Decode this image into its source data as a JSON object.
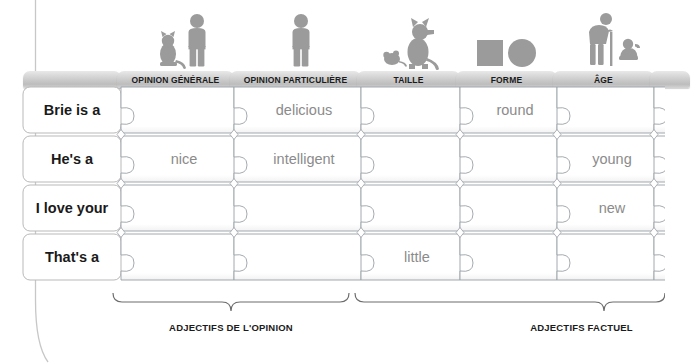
{
  "worksheet": {
    "title": "Ordre des adjectifs - puzzle",
    "icons": [
      {
        "name": "person-with-cat-icon",
        "column": "opinion-generale"
      },
      {
        "name": "person-icon",
        "column": "opinion-particuliere"
      },
      {
        "name": "dog-and-mouse-icon",
        "column": "taille"
      },
      {
        "name": "square-and-circle-icon",
        "column": "forme"
      },
      {
        "name": "elderly-person-and-child-icon",
        "column": "age"
      }
    ],
    "columns": [
      {
        "id": "subject",
        "label": ""
      },
      {
        "id": "opinion-generale",
        "label": "OPINION GÉNÉRALE"
      },
      {
        "id": "opinion-particuliere",
        "label": "OPINION PARTICULIÈRE"
      },
      {
        "id": "taille",
        "label": "TAILLE"
      },
      {
        "id": "forme",
        "label": "FORME"
      },
      {
        "id": "age",
        "label": "ÂGE"
      },
      {
        "id": "couleur",
        "label": ""
      }
    ],
    "rows": [
      {
        "label": "Brie is a",
        "cells": [
          "",
          "delicious",
          "",
          "round",
          "",
          ""
        ]
      },
      {
        "label": "He's a",
        "cells": [
          "nice",
          "intelligent",
          "",
          "",
          "young",
          ""
        ]
      },
      {
        "label": "I love your",
        "cells": [
          "",
          "",
          "",
          "",
          "new",
          ""
        ]
      },
      {
        "label": "That's a",
        "cells": [
          "",
          "",
          "little",
          "",
          "",
          ""
        ]
      }
    ],
    "braces": [
      {
        "id": "opinion",
        "label": "ADJECTIFS DE L'OPINION"
      },
      {
        "id": "factuel",
        "label": "ADJECTIFS FACTUEL"
      }
    ],
    "colors": {
      "tab_text": "#1b1b1b",
      "word_text": "#8b8b8b",
      "label_text": "#1a1a1a",
      "icon_fill": "#9a9a9a",
      "outline": "#9aa0a6"
    }
  }
}
